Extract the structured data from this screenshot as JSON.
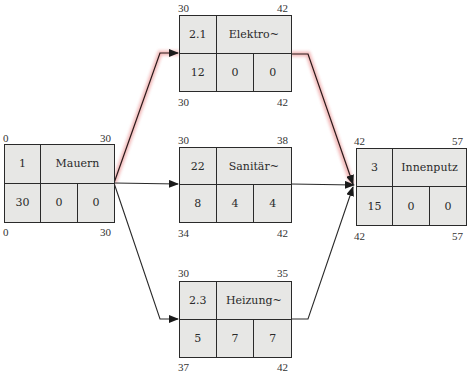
{
  "diagram": {
    "type": "activity-on-node network (Netzplan)",
    "critical_path_color": "#e07070",
    "line_color": "#2a2a2a",
    "node_fill": "#e7e7e5",
    "nodes": {
      "mauern": {
        "id": "1",
        "name": "Mauern",
        "duration": "30",
        "total_float": "0",
        "free_float": "0",
        "es": "0",
        "ef": "30",
        "ls": "0",
        "lf": "30",
        "critical": true
      },
      "elektro": {
        "id": "2.1",
        "name": "Elektro~",
        "duration": "12",
        "total_float": "0",
        "free_float": "0",
        "es": "30",
        "ef": "42",
        "ls": "30",
        "lf": "42",
        "critical": true
      },
      "sanitaer": {
        "id": "22",
        "name": "Sanitär~",
        "duration": "8",
        "total_float": "4",
        "free_float": "4",
        "es": "30",
        "ef": "38",
        "ls": "34",
        "lf": "42",
        "critical": false
      },
      "heizung": {
        "id": "2.3",
        "name": "Heizung~",
        "duration": "5",
        "total_float": "7",
        "free_float": "7",
        "es": "30",
        "ef": "35",
        "ls": "37",
        "lf": "42",
        "critical": false
      },
      "innenputz": {
        "id": "3",
        "name": "Innenputz",
        "duration": "15",
        "total_float": "0",
        "free_float": "0",
        "es": "42",
        "ef": "57",
        "ls": "42",
        "lf": "57",
        "critical": true
      }
    },
    "edges": [
      {
        "from": "Mauern",
        "to": "Elektro~",
        "critical": true
      },
      {
        "from": "Mauern",
        "to": "Sanitär~",
        "critical": false
      },
      {
        "from": "Mauern",
        "to": "Heizung~",
        "critical": false
      },
      {
        "from": "Elektro~",
        "to": "Innenputz",
        "critical": true
      },
      {
        "from": "Sanitär~",
        "to": "Innenputz",
        "critical": false
      },
      {
        "from": "Heizung~",
        "to": "Innenputz",
        "critical": false
      }
    ]
  }
}
